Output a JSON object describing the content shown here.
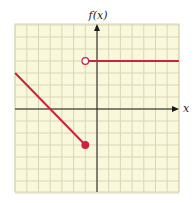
{
  "chart_data": {
    "type": "line",
    "title": "",
    "xlabel": "x",
    "ylabel": "f(x)",
    "xlim": [
      -7,
      7
    ],
    "ylim": [
      -7,
      7
    ],
    "grid": true,
    "grid_step": 1,
    "series": [
      {
        "name": "left-piece",
        "points": [
          [
            -7,
            3
          ],
          [
            -1,
            -3
          ]
        ],
        "start_marker": "none",
        "end_marker": "closed",
        "color": "#d0213f"
      },
      {
        "name": "right-piece",
        "points": [
          [
            -1,
            4
          ],
          [
            7,
            4
          ]
        ],
        "start_marker": "open",
        "end_marker": "none",
        "color": "#d0213f"
      }
    ]
  },
  "labels": {
    "y_axis": "f(x)",
    "x_axis": "x"
  },
  "colors": {
    "grid_bg": "#f9f8dc",
    "grid_line": "#d8d7b4",
    "axis": "#1a1a1a",
    "curve": "#d0213f"
  }
}
